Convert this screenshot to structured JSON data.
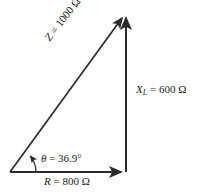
{
  "figure": {
    "type": "impedance-triangle",
    "background_color": "#ffffff",
    "line_color": "#2b2b2b",
    "text_color": "#1a1a1a"
  },
  "labels": {
    "hypotenuse": {
      "symbol": "Z",
      "equals": " = 1000 Ω",
      "full": "Z = 1000 Ω",
      "value": 1000,
      "unit": "Ω",
      "rotation_deg": -52
    },
    "vertical": {
      "symbol": "X",
      "subscript": "L",
      "equals": " = 600 Ω",
      "full": "X_L = 600 Ω",
      "value": 600,
      "unit": "Ω"
    },
    "horizontal": {
      "symbol": "R",
      "equals": " = 800 Ω",
      "full": "R = 800 Ω",
      "value": 800,
      "unit": "Ω"
    },
    "angle": {
      "symbol": "θ",
      "equals": " = 36.9°",
      "full": "θ = 36.9°",
      "value": 36.9,
      "unit": "°"
    }
  },
  "geometry": {
    "origin": {
      "x": 10,
      "y": 172
    },
    "corner": {
      "x": 126,
      "y": 172
    },
    "apex": {
      "x": 126,
      "y": 13
    },
    "arc_radius": 26
  }
}
